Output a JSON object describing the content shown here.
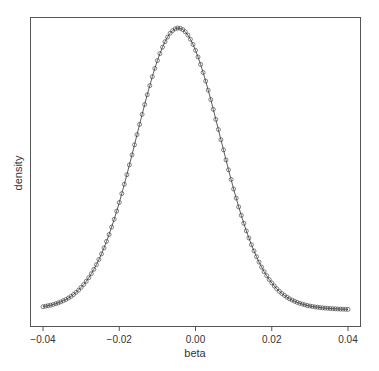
{
  "chart_data": {
    "type": "line",
    "title": "",
    "xlabel": "beta",
    "ylabel": "density",
    "xlim": [
      -0.04,
      0.04
    ],
    "x_ticks": [
      "-0.04",
      "-0.02",
      "0.00",
      "0.02",
      "0.04"
    ],
    "y_ticks": [],
    "grid": false,
    "legend": null,
    "series": [
      {
        "name": "density",
        "style": "line with open circle markers",
        "shape": "bell-shaped, peak near beta = -0.0045, sd approx 0.011",
        "x_range": [
          -0.04,
          0.04
        ],
        "n_points": 121,
        "peak_x": -0.0045,
        "sd": 0.011,
        "tail_relative_height": 0.045
      }
    ]
  }
}
